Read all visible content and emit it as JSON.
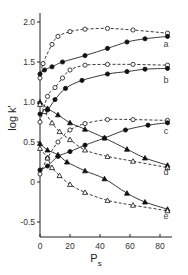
{
  "chart_data": {
    "type": "line",
    "title": "",
    "xlabel": "P",
    "xlabel_subscript": "s",
    "ylabel": "log k'",
    "xlim": [
      0,
      88
    ],
    "ylim": [
      -0.7,
      2.1
    ],
    "grid": false,
    "legend": "curve letters at right edge",
    "x_ticks": [
      0,
      20,
      40,
      60,
      80
    ],
    "x_tick_labels": [
      "0",
      "20",
      "40",
      "60",
      "80"
    ],
    "y_ticks": [
      -0.5,
      0,
      0.5,
      1.0,
      1.5,
      2.0
    ],
    "y_tick_labels": [
      "-0.5",
      "0",
      "0.5",
      "1.0",
      "1.5",
      "2.0"
    ],
    "series": [
      {
        "name": "a (open circles, dashed)",
        "curve": "a",
        "marker": "circle-open",
        "line": "dashed",
        "x": [
          0,
          2,
          8,
          12,
          20,
          30,
          45,
          62,
          85
        ],
        "y": [
          1.3,
          1.48,
          1.72,
          1.82,
          1.88,
          1.91,
          1.92,
          1.9,
          1.86
        ]
      },
      {
        "name": "a (filled circles, solid)",
        "curve": "a",
        "marker": "circle-filled",
        "line": "solid",
        "x": [
          0,
          3,
          8,
          15,
          30,
          45,
          58,
          70,
          85
        ],
        "y": [
          1.35,
          1.4,
          1.44,
          1.5,
          1.58,
          1.67,
          1.75,
          1.79,
          1.82
        ]
      },
      {
        "name": "b (open circles, dashed)",
        "curve": "b",
        "marker": "circle-open",
        "line": "dashed",
        "x": [
          0,
          5,
          10,
          15,
          20,
          30,
          45,
          62,
          85
        ],
        "y": [
          0.75,
          1.07,
          1.18,
          1.3,
          1.4,
          1.46,
          1.47,
          1.47,
          1.46
        ]
      },
      {
        "name": "b (filled circles, solid)",
        "curve": "b",
        "marker": "circle-filled",
        "line": "solid",
        "x": [
          0,
          5,
          10,
          17,
          28,
          45,
          58,
          70,
          85
        ],
        "y": [
          0.85,
          0.9,
          1.03,
          1.17,
          1.27,
          1.35,
          1.38,
          1.41,
          1.42
        ]
      },
      {
        "name": "c (open circles, dashed)",
        "curve": "c",
        "marker": "circle-open",
        "line": "dashed",
        "x": [
          0,
          5,
          12,
          20,
          30,
          45,
          62,
          85
        ],
        "y": [
          0.1,
          0.3,
          0.5,
          0.65,
          0.73,
          0.78,
          0.78,
          0.77
        ]
      },
      {
        "name": "c (filled circles, solid)",
        "curve": "c",
        "marker": "circle-filled",
        "line": "solid",
        "x": [
          0,
          5,
          12,
          20,
          30,
          43,
          57,
          72,
          85
        ],
        "y": [
          0.15,
          0.2,
          0.32,
          0.38,
          0.46,
          0.55,
          0.65,
          0.71,
          0.74
        ]
      },
      {
        "name": "d (filled triangles, solid)",
        "curve": "d",
        "marker": "triangle-filled",
        "line": "solid",
        "x": [
          0,
          5,
          12,
          20,
          30,
          43,
          58,
          70,
          85
        ],
        "y": [
          1.0,
          0.92,
          0.84,
          0.74,
          0.66,
          0.55,
          0.41,
          0.3,
          0.21
        ]
      },
      {
        "name": "d (open triangles, dashed)",
        "curve": "d",
        "marker": "triangle-open",
        "line": "dashed",
        "x": [
          0,
          3,
          8,
          13,
          20,
          30,
          45,
          62,
          85
        ],
        "y": [
          0.97,
          0.88,
          0.74,
          0.63,
          0.53,
          0.4,
          0.32,
          0.26,
          0.18
        ]
      },
      {
        "name": "e (filled triangles, solid)",
        "curve": "e",
        "marker": "triangle-filled",
        "line": "solid",
        "x": [
          0,
          5,
          12,
          18,
          30,
          43,
          58,
          70,
          85
        ],
        "y": [
          0.48,
          0.4,
          0.34,
          0.25,
          0.14,
          0.04,
          -0.14,
          -0.25,
          -0.34
        ]
      },
      {
        "name": "e (open triangles, dashed)",
        "curve": "e",
        "marker": "triangle-open",
        "line": "dashed",
        "x": [
          0,
          5,
          8,
          13,
          20,
          30,
          45,
          62,
          85
        ],
        "y": [
          0.42,
          0.3,
          0.18,
          0.08,
          -0.03,
          -0.13,
          -0.23,
          -0.29,
          -0.36
        ]
      }
    ],
    "curve_labels": [
      {
        "text": "a",
        "y": 1.72
      },
      {
        "text": "b",
        "y": 1.28
      },
      {
        "text": "c",
        "y": 0.64
      },
      {
        "text": "d",
        "y": 0.12
      },
      {
        "text": "e",
        "y": -0.42
      }
    ]
  },
  "axes": {
    "y_title": "log k'",
    "x_title": "P",
    "x_title_sub": "s"
  }
}
